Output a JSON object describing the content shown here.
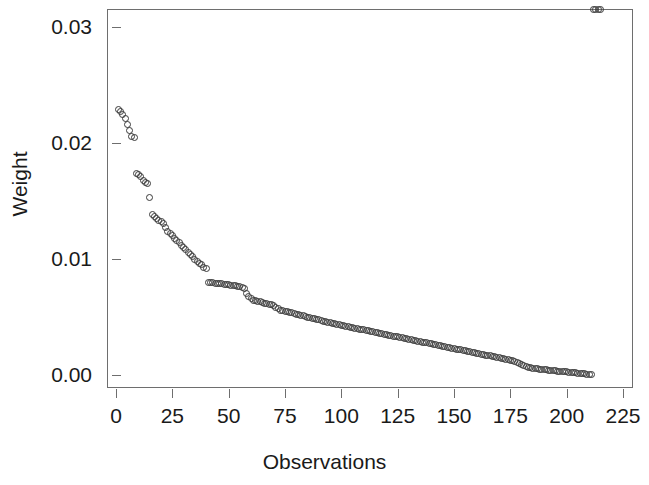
{
  "chart_data": {
    "type": "scatter",
    "title": "",
    "xlabel": "Observations",
    "ylabel": "Weight",
    "xlim": [
      0,
      225
    ],
    "ylim": [
      0.0,
      0.03
    ],
    "grid": false,
    "legend": null,
    "marker": "open-circle",
    "marker_color": "#3a3a3a",
    "xticks": [
      0,
      25,
      50,
      75,
      100,
      125,
      150,
      175,
      200,
      225
    ],
    "xtick_labels": [
      "0",
      "25",
      "50",
      "75",
      "100",
      "125",
      "150",
      "175",
      "200",
      "225"
    ],
    "yticks": [
      0.0,
      0.01,
      0.02,
      0.03
    ],
    "ytick_labels": [
      "0.00",
      "0.01",
      "0.02",
      "0.03"
    ],
    "x": [
      1,
      2,
      3,
      4,
      5,
      6,
      7,
      8,
      9,
      10,
      11,
      12,
      13,
      14,
      15,
      16,
      17,
      18,
      19,
      20,
      21,
      22,
      23,
      24,
      25,
      26,
      27,
      28,
      29,
      30,
      31,
      32,
      33,
      34,
      35,
      36,
      37,
      38,
      39,
      40,
      41,
      42,
      43,
      44,
      45,
      46,
      47,
      48,
      49,
      50,
      51,
      52,
      53,
      54,
      55,
      56,
      57,
      58,
      59,
      60,
      61,
      62,
      63,
      64,
      65,
      66,
      67,
      68,
      69,
      70,
      71,
      72,
      73,
      74,
      75,
      76,
      77,
      78,
      79,
      80,
      81,
      82,
      83,
      84,
      85,
      86,
      87,
      88,
      89,
      90,
      91,
      92,
      93,
      94,
      95,
      96,
      97,
      98,
      99,
      100,
      101,
      102,
      103,
      104,
      105,
      106,
      107,
      108,
      109,
      110,
      111,
      112,
      113,
      114,
      115,
      116,
      117,
      118,
      119,
      120,
      121,
      122,
      123,
      124,
      125,
      126,
      127,
      128,
      129,
      130,
      131,
      132,
      133,
      134,
      135,
      136,
      137,
      138,
      139,
      140,
      141,
      142,
      143,
      144,
      145,
      146,
      147,
      148,
      149,
      150,
      151,
      152,
      153,
      154,
      155,
      156,
      157,
      158,
      159,
      160,
      161,
      162,
      163,
      164,
      165,
      166,
      167,
      168,
      169,
      170,
      171,
      172,
      173,
      174,
      175,
      176,
      177,
      178,
      179,
      180,
      181,
      182,
      183,
      184,
      185,
      186,
      187,
      188,
      189,
      190,
      191,
      192,
      193,
      194,
      195,
      196,
      197,
      198,
      199,
      200,
      201,
      202,
      203,
      204,
      205,
      206,
      207,
      208,
      209,
      210,
      211,
      212,
      213,
      214,
      215
    ],
    "y": [
      0.0229,
      0.0227,
      0.0225,
      0.0221,
      0.0216,
      0.0211,
      0.0206,
      0.0205,
      0.0174,
      0.0173,
      0.0171,
      0.0168,
      0.0166,
      0.0165,
      0.0153,
      0.0138,
      0.0137,
      0.0135,
      0.0133,
      0.0132,
      0.0131,
      0.0127,
      0.0124,
      0.0122,
      0.012,
      0.0118,
      0.0116,
      0.0114,
      0.0112,
      0.011,
      0.0108,
      0.0106,
      0.0104,
      0.0102,
      0.01,
      0.0098,
      0.0096,
      0.0095,
      0.0093,
      0.0092,
      0.008,
      0.00798,
      0.00795,
      0.00792,
      0.0079,
      0.00788,
      0.00785,
      0.00782,
      0.0078,
      0.00778,
      0.00775,
      0.00772,
      0.0077,
      0.00765,
      0.0076,
      0.00755,
      0.0075,
      0.007,
      0.0068,
      0.0066,
      0.00645,
      0.0064,
      0.00635,
      0.0063,
      0.00625,
      0.0062,
      0.00615,
      0.0061,
      0.00605,
      0.006,
      0.0058,
      0.0057,
      0.0056,
      0.00555,
      0.0055,
      0.00545,
      0.0054,
      0.00535,
      0.0053,
      0.00525,
      0.0052,
      0.00515,
      0.0051,
      0.00505,
      0.005,
      0.00495,
      0.0049,
      0.00485,
      0.0048,
      0.00475,
      0.0047,
      0.00465,
      0.0046,
      0.00455,
      0.0045,
      0.00445,
      0.0044,
      0.00436,
      0.00432,
      0.00428,
      0.00424,
      0.0042,
      0.00416,
      0.00412,
      0.00408,
      0.00404,
      0.004,
      0.00396,
      0.00392,
      0.00388,
      0.00384,
      0.0038,
      0.00376,
      0.00372,
      0.00368,
      0.00364,
      0.0036,
      0.00356,
      0.00352,
      0.00348,
      0.00344,
      0.0034,
      0.00336,
      0.00332,
      0.00328,
      0.00324,
      0.0032,
      0.00316,
      0.00312,
      0.00308,
      0.00304,
      0.003,
      0.00296,
      0.00292,
      0.00288,
      0.00284,
      0.0028,
      0.00276,
      0.00272,
      0.00268,
      0.00264,
      0.0026,
      0.00256,
      0.00252,
      0.00248,
      0.00244,
      0.0024,
      0.00236,
      0.00232,
      0.00228,
      0.00224,
      0.0022,
      0.00216,
      0.00212,
      0.00208,
      0.00204,
      0.002,
      0.00196,
      0.00192,
      0.00188,
      0.00184,
      0.0018,
      0.00176,
      0.00172,
      0.00168,
      0.00164,
      0.0016,
      0.00156,
      0.00152,
      0.00148,
      0.00144,
      0.0014,
      0.00136,
      0.00132,
      0.00128,
      0.00124,
      0.0012,
      0.0011,
      0.001,
      0.0009,
      0.0008,
      0.00072,
      0.00066,
      0.00062,
      0.00058,
      0.00055,
      0.00052,
      0.0005,
      0.00048,
      0.00046,
      0.00044,
      0.00042,
      0.0004,
      0.00038,
      0.00036,
      0.00034,
      0.00032,
      0.0003,
      0.00028,
      0.00026,
      0.00024,
      0.00022,
      0.0002,
      0.00018,
      0.00016,
      0.00014,
      0.00012,
      0.0001,
      8e-05,
      6e-05,
      4e-05
    ]
  }
}
